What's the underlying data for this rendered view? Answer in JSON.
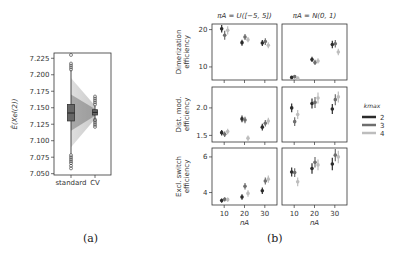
{
  "captions": {
    "a": "(a)",
    "b": "(b)"
  },
  "chart_data": [
    {
      "id": "a",
      "type": "box",
      "title": "",
      "xlabel": "",
      "ylabel": "Ê(X_el(2))",
      "ylabel_display": "Ê(Xel(2))",
      "categories": [
        "standard",
        "CV"
      ],
      "ylim": [
        7.048,
        7.233
      ],
      "yticks": [
        7.05,
        7.075,
        7.1,
        7.125,
        7.15,
        7.175,
        7.2,
        7.225
      ],
      "ytick_labels": [
        "7.050",
        "7.075",
        "7.100",
        "7.125",
        "7.150",
        "7.175",
        "7.200",
        "7.225"
      ],
      "boxes": [
        {
          "name": "standard",
          "q1": 7.13,
          "median": 7.142,
          "q3": 7.155,
          "whisker_low": 7.08,
          "whisker_high": 7.207,
          "outliers_low": [
            7.058,
            7.062,
            7.066,
            7.069,
            7.072,
            7.075,
            7.078
          ],
          "outliers_high": [
            7.208,
            7.211,
            7.214,
            7.217,
            7.23
          ]
        },
        {
          "name": "CV",
          "q1": 7.139,
          "median": 7.143,
          "q3": 7.147,
          "whisker_low": 7.133,
          "whisker_high": 7.153,
          "outliers_low": [
            7.121,
            7.124,
            7.127,
            7.13,
            7.132
          ],
          "outliers_high": [
            7.155,
            7.158,
            7.161,
            7.164,
            7.167
          ]
        }
      ],
      "grid": false
    },
    {
      "id": "b",
      "type": "errorbar_grid",
      "column_titles": [
        "π_A = U([−5, 5])",
        "π_A = N(0, 1)"
      ],
      "column_titles_display": [
        "πA = U([−5, 5])",
        "πA = N(0, 1)"
      ],
      "row_labels": [
        [
          "Dimerization",
          "efficiency"
        ],
        [
          "Dist. mod.",
          "efficiency"
        ],
        [
          "Excl. switch",
          "efficiency"
        ]
      ],
      "xlabel": "n_A",
      "xlabel_display": "nA",
      "x": [
        10,
        20,
        30
      ],
      "xtick_labels": [
        "10",
        "20",
        "30"
      ],
      "xlim": [
        4,
        36
      ],
      "legend": {
        "title": "k_max",
        "title_display": "kmax",
        "position": "right",
        "entries": [
          {
            "label": "2",
            "color": "#2b2b2b"
          },
          {
            "label": "3",
            "color": "#6e6e6e"
          },
          {
            "label": "4",
            "color": "#bdbdbd"
          }
        ]
      },
      "rows": [
        {
          "ylim": [
            6.5,
            21.5
          ],
          "yticks": [
            10,
            20
          ],
          "ytick_labels": [
            "10",
            "20"
          ],
          "panels": [
            {
              "series": [
                {
                  "name": "2",
                  "values": [
                    20.2,
                    16.5,
                    16.4
                  ],
                  "err": [
                    1.0,
                    0.8,
                    0.8
                  ]
                },
                {
                  "name": "3",
                  "values": [
                    18.5,
                    18.0,
                    16.8
                  ],
                  "err": [
                    1.2,
                    0.8,
                    0.9
                  ]
                },
                {
                  "name": "4",
                  "values": [
                    19.8,
                    17.3,
                    15.8
                  ],
                  "err": [
                    1.1,
                    0.7,
                    0.8
                  ]
                }
              ]
            },
            {
              "series": [
                {
                  "name": "2",
                  "values": [
                    7.2,
                    12.0,
                    16.0
                  ],
                  "err": [
                    0.4,
                    0.7,
                    1.0
                  ]
                },
                {
                  "name": "3",
                  "values": [
                    7.4,
                    11.2,
                    16.2
                  ],
                  "err": [
                    0.4,
                    0.7,
                    1.0
                  ]
                },
                {
                  "name": "4",
                  "values": [
                    7.0,
                    11.6,
                    14.0
                  ],
                  "err": [
                    0.4,
                    0.7,
                    0.9
                  ]
                }
              ]
            }
          ]
        },
        {
          "ylim": [
            1.38,
            2.38
          ],
          "yticks": [
            1.5,
            2.0
          ],
          "ytick_labels": [
            "1.5",
            "2.0"
          ],
          "panels": [
            {
              "series": [
                {
                  "name": "2",
                  "values": [
                    1.55,
                    1.8,
                    1.65
                  ],
                  "err": [
                    0.05,
                    0.06,
                    0.06
                  ]
                },
                {
                  "name": "3",
                  "values": [
                    1.52,
                    1.78,
                    1.72
                  ],
                  "err": [
                    0.05,
                    0.06,
                    0.06
                  ]
                },
                {
                  "name": "4",
                  "values": [
                    1.57,
                    1.45,
                    1.76
                  ],
                  "err": [
                    0.05,
                    0.05,
                    0.06
                  ]
                }
              ]
            },
            {
              "series": [
                {
                  "name": "2",
                  "values": [
                    2.0,
                    2.08,
                    1.98
                  ],
                  "err": [
                    0.08,
                    0.09,
                    0.09
                  ]
                },
                {
                  "name": "3",
                  "values": [
                    1.75,
                    2.1,
                    2.15
                  ],
                  "err": [
                    0.08,
                    0.1,
                    0.1
                  ]
                },
                {
                  "name": "4",
                  "values": [
                    1.88,
                    2.18,
                    2.2
                  ],
                  "err": [
                    0.08,
                    0.1,
                    0.1
                  ]
                }
              ]
            }
          ]
        },
        {
          "ylim": [
            3.3,
            6.5
          ],
          "yticks": [
            4,
            6
          ],
          "ytick_labels": [
            "4",
            "6"
          ],
          "panels": [
            {
              "series": [
                {
                  "name": "2",
                  "values": [
                    3.55,
                    3.75,
                    4.1
                  ],
                  "err": [
                    0.12,
                    0.15,
                    0.18
                  ]
                },
                {
                  "name": "3",
                  "values": [
                    3.62,
                    4.35,
                    4.65
                  ],
                  "err": [
                    0.12,
                    0.18,
                    0.2
                  ]
                },
                {
                  "name": "4",
                  "values": [
                    3.6,
                    3.95,
                    4.75
                  ],
                  "err": [
                    0.12,
                    0.18,
                    0.2
                  ]
                }
              ]
            },
            {
              "series": [
                {
                  "name": "2",
                  "values": [
                    5.15,
                    5.35,
                    5.6
                  ],
                  "err": [
                    0.25,
                    0.3,
                    0.35
                  ]
                },
                {
                  "name": "3",
                  "values": [
                    5.12,
                    5.7,
                    6.1
                  ],
                  "err": [
                    0.25,
                    0.3,
                    0.35
                  ]
                },
                {
                  "name": "4",
                  "values": [
                    4.6,
                    5.55,
                    6.0
                  ],
                  "err": [
                    0.25,
                    0.3,
                    0.35
                  ]
                }
              ]
            }
          ]
        }
      ]
    }
  ]
}
